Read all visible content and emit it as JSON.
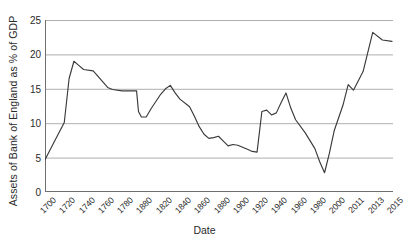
{
  "chart_data": {
    "type": "line",
    "title": "",
    "xlabel": "Date",
    "ylabel": "Assets of Bank of England as % of GDP",
    "ylim": [
      0,
      25
    ],
    "yticks": [
      0,
      5,
      10,
      15,
      20,
      25
    ],
    "grid": true,
    "legend": "none",
    "xtick_labels": [
      "1700",
      "1720",
      "1740",
      "1760",
      "1780",
      "1880",
      "1820",
      "1840",
      "1860",
      "1880",
      "1900",
      "1920",
      "1940",
      "1960",
      "1980",
      "2000",
      "2011",
      "2013",
      "2015"
    ],
    "series": [
      {
        "name": "Assets of Bank of England as % of GDP",
        "color": "#3a3a3a",
        "x": [
          1700,
          1710,
          1720,
          1725,
          1730,
          1735,
          1740,
          1750,
          1760,
          1765,
          1770,
          1780,
          1790,
          1795,
          1797,
          1800,
          1805,
          1810,
          1820,
          1825,
          1830,
          1835,
          1840,
          1850,
          1855,
          1860,
          1865,
          1870,
          1875,
          1880,
          1885,
          1890,
          1895,
          1900,
          1910,
          1915,
          1920,
          1925,
          1930,
          1935,
          1940,
          1945,
          1950,
          1955,
          1960,
          1970,
          1980,
          1985,
          1990,
          1995,
          2000,
          2005,
          2008,
          2011,
          2012,
          2013,
          2014,
          2015
        ],
        "values": [
          4.7,
          7.4,
          10.1,
          16.5,
          19.0,
          18.4,
          17.8,
          17.6,
          16.0,
          15.2,
          14.9,
          14.7,
          14.7,
          14.7,
          11.7,
          10.9,
          10.9,
          12.1,
          14.2,
          15.0,
          15.5,
          14.4,
          13.5,
          12.4,
          11.0,
          9.5,
          8.4,
          7.8,
          7.9,
          8.1,
          7.4,
          6.7,
          6.9,
          6.8,
          6.2,
          5.9,
          5.8,
          11.7,
          11.9,
          11.2,
          11.5,
          13.0,
          14.4,
          12.2,
          10.5,
          8.6,
          6.3,
          4.4,
          2.8,
          5.6,
          8.9,
          12.6,
          15.6,
          14.8,
          17.5,
          23.2,
          22.1,
          21.9
        ]
      }
    ]
  }
}
